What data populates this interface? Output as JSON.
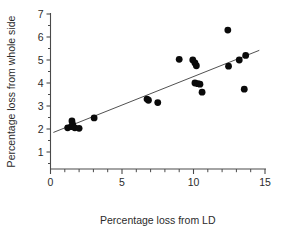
{
  "chart_data": {
    "type": "scatter",
    "title": "",
    "xlabel": "Percentage loss from LD",
    "ylabel": "Percentage loss from whole side",
    "xlim": [
      0,
      15
    ],
    "ylim": [
      0,
      7
    ],
    "x_ticks_major": [
      0,
      5,
      10,
      15
    ],
    "x_tick_labels": [
      "0",
      "5",
      "10",
      "15"
    ],
    "x_ticks_minor": [
      1,
      2,
      3,
      4,
      6,
      7,
      8,
      9,
      11,
      12,
      13,
      14
    ],
    "y_ticks_major": [
      1,
      2,
      3,
      4,
      5,
      6,
      7
    ],
    "y_tick_labels": [
      "1",
      "2",
      "3",
      "4",
      "5",
      "6",
      "7"
    ],
    "grid": false,
    "legend": false,
    "marker_color": "#0a0a0a",
    "line_color": "#3d3d3d",
    "points": [
      {
        "x": 1.2,
        "y": 2.05
      },
      {
        "x": 1.45,
        "y": 2.1
      },
      {
        "x": 1.5,
        "y": 2.35
      },
      {
        "x": 1.55,
        "y": 2.2
      },
      {
        "x": 1.7,
        "y": 2.05
      },
      {
        "x": 2.0,
        "y": 2.03
      },
      {
        "x": 3.05,
        "y": 2.48
      },
      {
        "x": 6.75,
        "y": 3.3
      },
      {
        "x": 6.85,
        "y": 3.25
      },
      {
        "x": 7.5,
        "y": 3.15
      },
      {
        "x": 9.0,
        "y": 5.03
      },
      {
        "x": 9.95,
        "y": 5.0
      },
      {
        "x": 10.1,
        "y": 4.87
      },
      {
        "x": 10.2,
        "y": 4.75
      },
      {
        "x": 10.1,
        "y": 4.0
      },
      {
        "x": 10.3,
        "y": 3.97
      },
      {
        "x": 10.45,
        "y": 3.95
      },
      {
        "x": 10.6,
        "y": 3.6
      },
      {
        "x": 12.4,
        "y": 6.3
      },
      {
        "x": 12.45,
        "y": 4.73
      },
      {
        "x": 13.2,
        "y": 5.0
      },
      {
        "x": 13.65,
        "y": 5.2
      },
      {
        "x": 13.55,
        "y": 3.73
      }
    ],
    "fit_line": {
      "x_start": 0.2,
      "y_start": 1.85,
      "x_end": 14.6,
      "y_end": 5.42
    }
  }
}
